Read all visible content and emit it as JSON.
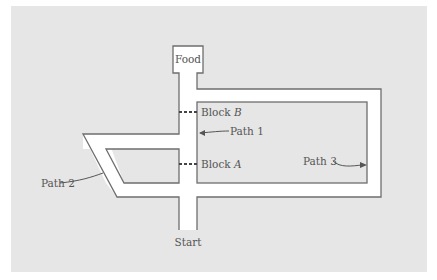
{
  "diagram": {
    "type": "maze",
    "colors": {
      "page": "#ffffff",
      "panel": "#e6e6e6",
      "corridor": "#ffffff",
      "wall": "#6e6e6e",
      "label": "#555555"
    },
    "labels": {
      "food": "Food",
      "start": "Start",
      "block_b_prefix": "Block ",
      "block_b_letter": "B",
      "block_a_prefix": "Block ",
      "block_a_letter": "A",
      "path1": "Path 1",
      "path2": "Path 2",
      "path3": "Path 3"
    },
    "nodes": [
      {
        "id": "food",
        "label": "Food",
        "role": "goal box"
      },
      {
        "id": "start",
        "label": "Start",
        "role": "start"
      },
      {
        "id": "block_b",
        "label": "Block B",
        "role": "barrier on path 1 (upper)"
      },
      {
        "id": "block_a",
        "label": "Block A",
        "role": "barrier on path 1 (lower)"
      }
    ],
    "paths": [
      {
        "id": "path1",
        "label": "Path 1",
        "description": "straight central corridor from Start to Food"
      },
      {
        "id": "path2",
        "label": "Path 2",
        "description": "left parallelogram detour rejoining central corridor between Block A and Block B"
      },
      {
        "id": "path3",
        "label": "Path 3",
        "description": "long right rectangular loop reaching Food directly"
      }
    ]
  }
}
